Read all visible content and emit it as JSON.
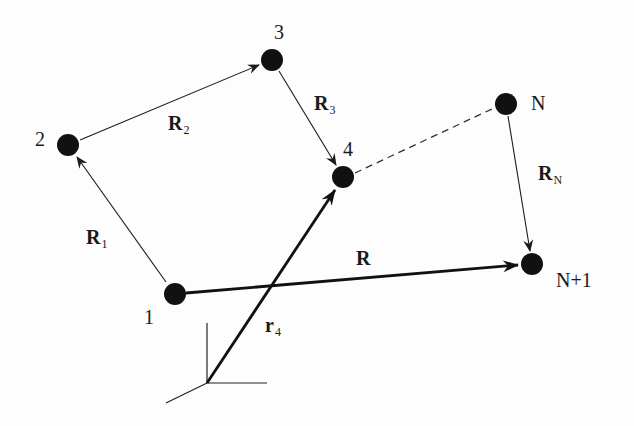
{
  "diagram": {
    "colors": {
      "line": "#1a1a1a",
      "node": "#111111",
      "dashed": "#333333",
      "background": "#fdfdfd"
    },
    "nodes": [
      {
        "id": "1",
        "label": "1",
        "x": 175,
        "y": 294
      },
      {
        "id": "2",
        "label": "2",
        "x": 68,
        "y": 145
      },
      {
        "id": "3",
        "label": "3",
        "x": 272,
        "y": 60
      },
      {
        "id": "4",
        "label": "4",
        "x": 343,
        "y": 177
      },
      {
        "id": "N",
        "label": "N",
        "x": 506,
        "y": 104
      },
      {
        "id": "N+1",
        "label": "N+1",
        "x": 532,
        "y": 264
      }
    ],
    "bonds": [
      {
        "from": "1",
        "to": "2",
        "label": "R",
        "sub": "1",
        "style": "thin-arrow"
      },
      {
        "from": "2",
        "to": "3",
        "label": "R",
        "sub": "2",
        "style": "thin-arrow"
      },
      {
        "from": "3",
        "to": "4",
        "label": "R",
        "sub": "3",
        "style": "thin-arrow"
      },
      {
        "from": "4",
        "to": "N",
        "label": "",
        "sub": "",
        "style": "dashed"
      },
      {
        "from": "N",
        "to": "N+1",
        "label": "R",
        "sub": "N",
        "style": "thin-arrow"
      }
    ],
    "vectors": [
      {
        "from": "1",
        "to": "N+1",
        "label": "R",
        "sub": "",
        "style": "thick-arrow"
      },
      {
        "from": "origin",
        "to": "4",
        "label": "r",
        "sub": "4",
        "style": "thick-arrow"
      }
    ],
    "axes": {
      "origin_x": 207,
      "origin_y": 383
    }
  }
}
